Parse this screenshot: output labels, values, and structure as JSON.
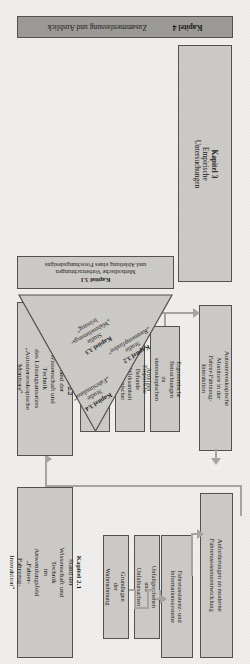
{
  "diagram": {
    "language": "de",
    "orientation_note": "page scanned upside down",
    "colors": {
      "page_background": "#efeeec",
      "box_fill": "#cccac6",
      "chapter4_fill": "#9c9a96",
      "box_border": "#55524e",
      "connector": "#a7a5a1",
      "text": "#1c1a18"
    }
  },
  "chapter4": {
    "number": "Kapitel 4",
    "title": "Zusammenfassung und Ausblick"
  },
  "chapter3": {
    "number": "Kapitel 3",
    "title": "Empirische Untersuchungen",
    "methods": {
      "number": "Kapitel 3.1",
      "line1": "Methodische Vorbetrachtungen",
      "line2": "und Ableitung eines Forschungsdesigns"
    },
    "studies": [
      {
        "number": "Kapitel 3.2",
        "kind": "Studie",
        "name": "„Raumempfinden“"
      },
      {
        "number": "Kapitel 3.3",
        "kind": "Studie",
        "name": "„Wahrnehmungs-",
        "name2": "leistung“"
      },
      {
        "number": "Kapitel 3.4",
        "kind": "Studie",
        "name": "„Fahrsimulator“"
      }
    ]
  },
  "chapter22": {
    "number": "Kapitel 2.2",
    "line1": "Stand der Wissenschaft und Technik",
    "line2": "des Lösungsansatzes",
    "line3": "„Autostereoskopische Monitore“",
    "subboxes": [
      {
        "line1": "Funktionsweise",
        "line2": "stereoskopischer Anzeigen"
      },
      {
        "line1": "Empirische Befunde",
        "line2": "zur Wirksamkeit",
        "line3": "stereoskopischer Anzeigen"
      },
      {
        "line1": "Ergonomische Betrachtungen",
        "line2": "zu stereoskopischen Anzeigen"
      }
    ],
    "result": {
      "line1": "Autostereoskopische Monitore in der",
      "line2": "Fahrer-Fahrzeug-Interaktion"
    }
  },
  "chapter21": {
    "number": "Kapitel 2.1",
    "line1": "Stand der Wissenschaft und Technik",
    "line2": "im Anwendungsfeld",
    "line3": "„Fahrer-Fahrzeug-Interaktion“",
    "subboxes": [
      {
        "line1": "Grundlagen der",
        "line2": "Wahrnehmung"
      },
      {
        "line1": "Unfallgeschehen und",
        "line2": "Unfallursachen"
      },
      {
        "line1": "Fahrerassistenz- und",
        "line2": "Informationssysteme"
      }
    ],
    "result": {
      "line1": "Anforderungen an moderne",
      "line2": "Fahrerassistenzentwicklung"
    }
  }
}
